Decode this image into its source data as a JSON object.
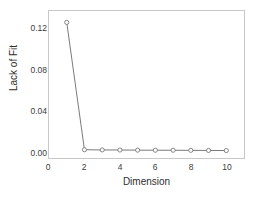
{
  "chart_data": {
    "type": "line",
    "title": "",
    "subtitle": "",
    "xlabel": "Dimension",
    "ylabel": "Lack of Fit",
    "x": [
      1,
      2,
      3,
      4,
      5,
      6,
      7,
      8,
      9,
      10
    ],
    "values": [
      0.125,
      0.002,
      0.0018,
      0.0017,
      0.0016,
      0.0015,
      0.0015,
      0.0014,
      0.0013,
      0.0012
    ],
    "series": [
      {
        "name": "Lack of Fit",
        "values": [
          0.125,
          0.002,
          0.0018,
          0.0017,
          0.0016,
          0.0015,
          0.0015,
          0.0014,
          0.0013,
          0.0012
        ]
      }
    ],
    "xlim": [
      0,
      11
    ],
    "ylim": [
      -0.006,
      0.136
    ],
    "xticks": [
      0,
      2,
      4,
      6,
      8,
      10
    ],
    "xtick_labels": [
      "0",
      "2",
      "4",
      "6",
      "8",
      "10"
    ],
    "yticks": [
      0.0,
      0.04,
      0.08,
      0.12
    ],
    "ytick_labels": [
      "0.00",
      "0.04",
      "0.08",
      "0.12"
    ],
    "grid": false,
    "legend": false,
    "legend_position": "none",
    "marker": "open-circle",
    "line_color": "#6b6b6b",
    "marker_color": "#6b6b6b",
    "marker_fill": "#ffffff",
    "frame_color": "#c8c8c8",
    "background_color": "#ffffff",
    "annotations": []
  }
}
